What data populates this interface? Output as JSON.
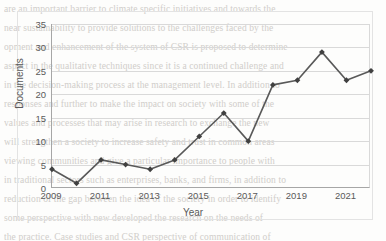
{
  "chart_data": {
    "type": "line",
    "title": "",
    "xlabel": "Year",
    "ylabel": "Documents",
    "categories": [
      2009,
      2010,
      2011,
      2012,
      2013,
      2014,
      2015,
      2016,
      2017,
      2018,
      2019,
      2020,
      2021,
      2022
    ],
    "values": [
      4,
      1,
      6,
      5,
      4,
      6,
      11,
      16,
      10,
      22,
      23,
      29,
      23,
      25
    ],
    "series": [
      {
        "name": "Documents",
        "values": [
          4,
          1,
          6,
          5,
          4,
          6,
          11,
          16,
          10,
          22,
          23,
          29,
          23,
          25
        ]
      }
    ],
    "xlim": [
      2009,
      2022
    ],
    "ylim": [
      0,
      35
    ],
    "ytick_labels": [
      "0",
      "5",
      "10",
      "15",
      "20",
      "25",
      "30",
      "35"
    ],
    "ytick_values": [
      0,
      5,
      10,
      15,
      20,
      25,
      30,
      35
    ],
    "xtick_labels": [
      "2009",
      "2011",
      "2013",
      "2015",
      "2017",
      "2019",
      "2021"
    ],
    "xtick_values": [
      2009,
      2011,
      2013,
      2015,
      2017,
      2019,
      2021
    ],
    "grid": "horizontal",
    "legend": "none",
    "line_color": "#595959",
    "marker_color": "#404040",
    "marker_shape": "diamond",
    "gridline_color": "#d9d9d9",
    "axis_color": "#a6a6a6",
    "text_color": "#5a5a5a",
    "background_color": "#fdfdfc"
  },
  "background_text": {
    "lines": [
      "are an important barrier to climate specific initiatives and towards the",
      "near sustainability to provide solutions to the challenges faced by the",
      "",
      "opment and enhancement of the system of CSR is proposed to determine",
      "aspect in the qualitative techniques since it is a continued challenge and",
      "in the decision-making process at the management level. In addition to",
      "responses and further to make the impact on society with some of the",
      "values and processes that may arise in research to exchange the new",
      "will strengthen a society to increase safety and trust in common areas",
      "viewing communities and give a particular importance to people with",
      "in traditional sectors such as enterprises, banks, and firms, in addition to",
      "reduction of the gap between the idea of the society in order to identify",
      "some perspective with new developed the research on the needs of",
      "the practice. Case studies and CSR perspective of communication of"
    ]
  }
}
